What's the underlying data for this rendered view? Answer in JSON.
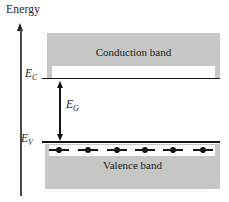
{
  "diagram": {
    "axis_label": "Energy",
    "bands": {
      "conduction": {
        "label": "Conduction band"
      },
      "valence": {
        "label": "Valence band"
      }
    },
    "levels": {
      "ec": {
        "base": "E",
        "sub": "C"
      },
      "ev": {
        "base": "E",
        "sub": "V"
      },
      "eg": {
        "base": "E",
        "sub": "G"
      }
    },
    "electrons": {
      "count": 6,
      "x_centers_px": [
        59,
        88,
        117,
        145,
        173,
        203
      ]
    },
    "colors": {
      "band_fill": "#c4c7c4",
      "ink": "#1a1a1a",
      "background": "#ffffff"
    }
  }
}
